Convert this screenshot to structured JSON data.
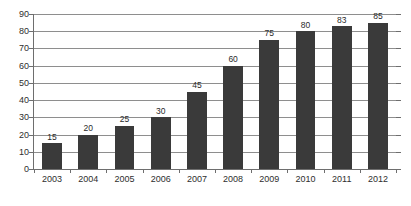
{
  "chart_data": {
    "type": "bar",
    "title": "",
    "subtitle": "",
    "xlabel": "",
    "ylabel": "",
    "categories": [
      "2003",
      "2004",
      "2005",
      "2006",
      "2007",
      "2008",
      "2009",
      "2010",
      "2011",
      "2012"
    ],
    "values": [
      15,
      20,
      25,
      30,
      45,
      60,
      75,
      80,
      83,
      85
    ],
    "value_labels": [
      "15",
      "20",
      "25",
      "30",
      "45",
      "60",
      "75",
      "80",
      "83",
      "85"
    ],
    "ylim": [
      0,
      90
    ],
    "ytick_step": 10,
    "ytick_labels": [
      "90",
      "80",
      "70",
      "60",
      "50",
      "40",
      "30",
      "20",
      "10",
      "0"
    ],
    "ytick_values": [
      90,
      80,
      70,
      60,
      50,
      40,
      30,
      20,
      10,
      0
    ],
    "grid": true,
    "grid_axis": "y",
    "legend": false,
    "legend_position": "none",
    "data_labels": true,
    "colors": {
      "bar": "#3a3a3a",
      "gridline": "#8e8e8e",
      "axis": "#6e6e6e",
      "text": "#2e2e2e",
      "background": "#ffffff"
    }
  }
}
